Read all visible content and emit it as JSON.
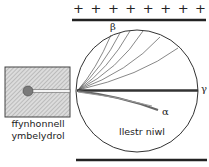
{
  "diagram": {
    "plates": {
      "top_charge_symbols": [
        "+",
        "+",
        "+",
        "+",
        "+",
        "+",
        "+",
        "+"
      ],
      "top_plate_label": "positive plate",
      "bottom_plate_label": "negative plate"
    },
    "source": {
      "label_line1": "ffynhonnell",
      "label_line2": "ymbelydrol"
    },
    "chamber": {
      "label": "llestr niwl"
    },
    "rays": {
      "alpha": "α",
      "beta": "β",
      "gamma": "γ"
    },
    "colors": {
      "line": "#222222",
      "hatch_bg": "#d8d8d8",
      "source_dot": "#777777"
    }
  }
}
